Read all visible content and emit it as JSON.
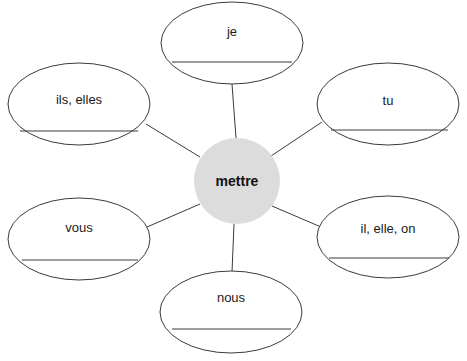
{
  "diagram": {
    "type": "spider-web-conjugation-chart",
    "center": {
      "label": "mettre",
      "cx": 237,
      "cy": 181,
      "r": 43,
      "fill": "#dcdcdc"
    },
    "ellipse_style": {
      "stroke": "#3a3a3a",
      "stroke_width": 1,
      "fill": "#ffffff",
      "rx": 71,
      "ry": 41
    },
    "writing_line": {
      "stroke": "#3a3a3a",
      "stroke_width": 1
    },
    "connector": {
      "stroke": "#3a3a3a",
      "stroke_width": 1
    },
    "nodes": [
      {
        "id": "je",
        "label": "je",
        "cx": 232,
        "cy": 43,
        "label_y": 31,
        "line_y": 62,
        "line_x1": 172,
        "line_x2": 292
      },
      {
        "id": "tu",
        "label": "tu",
        "cx": 388,
        "cy": 104,
        "label_y": 100,
        "line_y": 130,
        "line_x1": 331,
        "line_x2": 448
      },
      {
        "id": "il-elle-on",
        "label": "il, elle, on",
        "cx": 388,
        "cy": 237,
        "label_y": 228,
        "line_y": 258,
        "line_x1": 329,
        "line_x2": 449
      },
      {
        "id": "nous",
        "label": "nous",
        "cx": 231,
        "cy": 312,
        "label_y": 297,
        "line_y": 329,
        "line_x1": 172,
        "line_x2": 291
      },
      {
        "id": "vous",
        "label": "vous",
        "cx": 79,
        "cy": 239,
        "label_y": 227,
        "line_y": 260,
        "line_x1": 22,
        "line_x2": 138
      },
      {
        "id": "ils-elles",
        "label": "ils, elles",
        "cx": 79,
        "cy": 104,
        "label_y": 99,
        "line_y": 131,
        "line_x1": 20,
        "line_x2": 138
      }
    ],
    "connectors": [
      {
        "id": "connector-je",
        "x1": 236,
        "y1": 138,
        "x2": 232,
        "y2": 84
      },
      {
        "id": "connector-tu",
        "x1": 271,
        "y1": 156,
        "x2": 322,
        "y2": 122
      },
      {
        "id": "connector-il-elle-on",
        "x1": 272,
        "y1": 206,
        "x2": 321,
        "y2": 227
      },
      {
        "id": "connector-nous",
        "x1": 234,
        "y1": 224,
        "x2": 232,
        "y2": 272
      },
      {
        "id": "connector-vous",
        "x1": 200,
        "y1": 204,
        "x2": 147,
        "y2": 227
      },
      {
        "id": "connector-ils-elles",
        "x1": 200,
        "y1": 157,
        "x2": 146,
        "y2": 124
      }
    ]
  }
}
